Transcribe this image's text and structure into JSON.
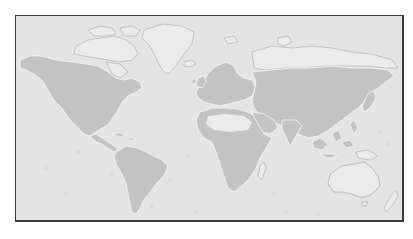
{
  "map": {
    "type": "world-distribution-map",
    "projection": "equirectangular-like",
    "colors": {
      "ocean": "#e4e4e4",
      "land_unshaded": "#ebebeb",
      "land_shaded": "#c3c3c3",
      "coastline": "#f8f8f8",
      "coastline_dark": "#9a9a9a",
      "frame_border": "#3a3a3a"
    },
    "shaded_regions": [
      "North America (south of Arctic)",
      "Central America",
      "South America",
      "Europe",
      "Africa (excluding Sahara)",
      "Asia (south of Arctic coast)",
      "Southeast Asia"
    ],
    "unshaded_regions": [
      "Arctic Canada",
      "Greenland",
      "Iceland",
      "Sahara",
      "Arctic Russia coast",
      "Australia",
      "New Zealand",
      "Pacific islands"
    ]
  }
}
